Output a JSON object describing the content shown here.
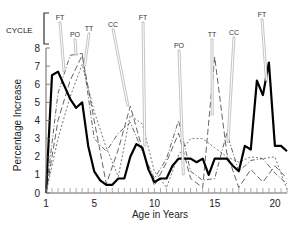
{
  "chart_data": {
    "type": "line",
    "title": "",
    "xlabel": "Age in Years",
    "ylabel": "Percentage Increase",
    "xlim": [
      1,
      21
    ],
    "ylim": [
      0,
      8
    ],
    "x_ticks": [
      1,
      5,
      10,
      15,
      20
    ],
    "y_ticks": [
      0,
      1,
      2,
      3,
      4,
      5,
      6,
      7,
      8
    ],
    "grid": false,
    "legend": "none (series labelled by annotations)",
    "cycle_label": "CYCLE",
    "annotations": [
      {
        "label": "FT",
        "x": 2.5,
        "y": 6.7
      },
      {
        "label": "PO",
        "x": 3.5,
        "y": 7.6
      },
      {
        "label": "TT",
        "x": 4.2,
        "y": 7.0
      },
      {
        "label": "CC",
        "x": 7.8,
        "y": 4.8
      },
      {
        "label": "FT",
        "x": 9.2,
        "y": 2.6
      },
      {
        "label": "PO",
        "x": 12.4,
        "y": 1.0
      },
      {
        "label": "TT",
        "x": 14.8,
        "y": 4.3
      },
      {
        "label": "CC",
        "x": 16.1,
        "y": 2.8
      },
      {
        "label": "FT",
        "x": 19.3,
        "y": 6.2
      }
    ],
    "series": [
      {
        "name": "FT (solid bold)",
        "style": "solid",
        "x": [
          1,
          1.5,
          2,
          3,
          3.5,
          4,
          4.5,
          5,
          5.5,
          6,
          6.5,
          7,
          7.5,
          8,
          8.5,
          9,
          9.5,
          10,
          10.5,
          11,
          11.5,
          12,
          12.5,
          13,
          13.5,
          14,
          14.5,
          15,
          15.5,
          16,
          16.5,
          17,
          17.5,
          18,
          18.5,
          19,
          19.5,
          20,
          20.5,
          21
        ],
        "values": [
          0,
          6.5,
          6.7,
          5.2,
          4.7,
          5.0,
          2.6,
          1.2,
          0.7,
          0.45,
          0.45,
          0.8,
          0.8,
          2.0,
          2.7,
          2.5,
          1.3,
          0.6,
          0.8,
          0.8,
          1.5,
          1.9,
          1.9,
          1.9,
          1.7,
          1.9,
          1.0,
          1.9,
          1.9,
          1.9,
          1.5,
          1.2,
          2.6,
          2.4,
          6.2,
          5.4,
          7.2,
          2.6,
          2.6,
          2.3
        ]
      },
      {
        "name": "PO (dash-dot)",
        "style": "dash-dot",
        "x": [
          1,
          2,
          3,
          4,
          5,
          6,
          7,
          8,
          9,
          10,
          11,
          12,
          13,
          14,
          15,
          16,
          17,
          18,
          19,
          20,
          21
        ],
        "values": [
          0,
          5.5,
          7.6,
          7.7,
          3.0,
          2.3,
          3.3,
          3.9,
          2.3,
          0.8,
          1.9,
          4.0,
          1.2,
          0.7,
          0.8,
          3.3,
          1.2,
          1.8,
          1.9,
          1.1,
          0.5
        ]
      },
      {
        "name": "TT (long dash)",
        "style": "long-dash",
        "x": [
          1,
          2,
          3,
          4,
          5,
          6,
          7,
          8,
          9,
          10,
          11,
          12,
          13,
          14,
          15,
          16,
          17,
          18,
          19,
          20,
          21
        ],
        "values": [
          0,
          4.0,
          6.2,
          7.6,
          4.0,
          0.5,
          2.4,
          4.8,
          2.4,
          0.4,
          1.7,
          3.3,
          0.8,
          0.3,
          7.5,
          2.2,
          0.3,
          1.3,
          0.6,
          1.5,
          0.8
        ]
      },
      {
        "name": "CC (short dash)",
        "style": "short-dash",
        "x": [
          1,
          2,
          3,
          4,
          5,
          6,
          7,
          8,
          9,
          10,
          11,
          12,
          13,
          14,
          15,
          16,
          17,
          18,
          19,
          20,
          21
        ],
        "values": [
          0,
          3.0,
          5.3,
          7.1,
          4.5,
          2.5,
          0.9,
          4.3,
          3.8,
          1.2,
          0.3,
          2.1,
          3.0,
          3.0,
          2.5,
          2.0,
          1.7,
          2.0,
          1.9,
          2.0,
          0.2
        ]
      }
    ]
  }
}
